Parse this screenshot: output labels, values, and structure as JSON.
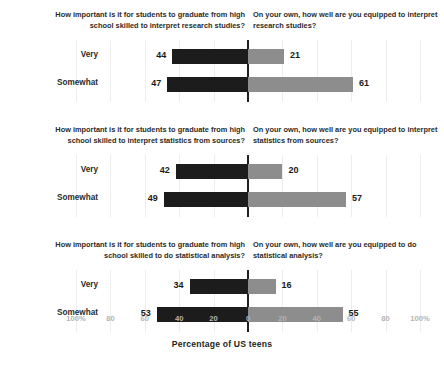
{
  "chart_data": {
    "type": "bar",
    "orientation": "horizontal",
    "style": "diverging-paired-bar",
    "title": "",
    "xlabel": "Percentage of US teens",
    "ylabel": "",
    "categories": [
      "Very",
      "Somewhat"
    ],
    "axis": {
      "tick_labels": [
        "100%",
        "80",
        "60",
        "40",
        "20",
        "0",
        "20",
        "40",
        "60",
        "80",
        "100%"
      ],
      "tick_values": [
        -100,
        -80,
        -60,
        -40,
        -20,
        0,
        20,
        40,
        60,
        80,
        100
      ],
      "xlim": [
        -100,
        100
      ],
      "grid": true,
      "zero_line": true
    },
    "legend": {
      "position": "none"
    },
    "series": [
      {
        "name": "How important is it for students to graduate from high school skilled to interpret research studies?",
        "side": "left",
        "color": "#1c1c1c"
      },
      {
        "name": "On your own, how well are you equipped to interpret research studies?",
        "side": "right",
        "color": "#8d8d8d"
      }
    ],
    "panels": [
      {
        "left_header": "How important is it for students to graduate from high school skilled to interpret research studies?",
        "right_header": "On your own, how well are you equipped to interpret research studies?",
        "rows": [
          {
            "label": "Very",
            "left": 44,
            "right": 21
          },
          {
            "label": "Somewhat",
            "left": 47,
            "right": 61
          }
        ]
      },
      {
        "left_header": "How important is it for students to graduate from high school skilled to interpret statistics from sources?",
        "right_header": "On your own, how well are you equipped to interpret statistics from sources?",
        "rows": [
          {
            "label": "Very",
            "left": 42,
            "right": 20
          },
          {
            "label": "Somewhat",
            "left": 49,
            "right": 57
          }
        ]
      },
      {
        "left_header": "How important is it for students to graduate from high school skilled to do statistical analysis?",
        "right_header": "On your own, how well are you equipped to do statistical analysis?",
        "rows": [
          {
            "label": "Very",
            "left": 34,
            "right": 16
          },
          {
            "label": "Somewhat",
            "left": 53,
            "right": 55
          }
        ]
      }
    ],
    "colors": {
      "left_bar": "#1c1c1c",
      "right_bar": "#8d8d8d",
      "zero_line": "#231f20",
      "gridline": "#ededed",
      "tick_label": "#b4b4b4",
      "text": "#231f20",
      "background": "#ffffff"
    }
  }
}
